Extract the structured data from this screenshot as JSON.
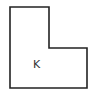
{
  "diagram": {
    "type": "L-shaped polygon",
    "label": "K",
    "stroke_color": "#222222",
    "fill_color": "#ffffff",
    "label_color": "#333333",
    "vertices": [
      [
        10,
        7
      ],
      [
        49,
        7
      ],
      [
        49,
        48
      ],
      [
        87,
        48
      ],
      [
        87,
        88
      ],
      [
        10,
        88
      ]
    ]
  }
}
